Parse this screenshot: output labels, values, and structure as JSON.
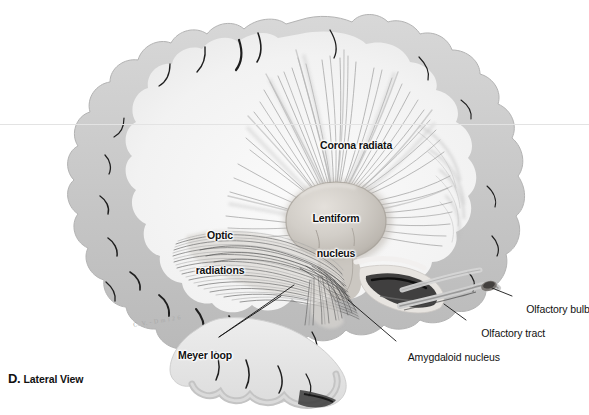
{
  "figure": {
    "kind": "anatomical-illustration",
    "caption_letter": "D.",
    "caption_text": "Lateral View",
    "artist_signature": "C. V. - D m i 2 6",
    "palette": {
      "background": "#ffffff",
      "cortex_gray": "#c9c9c9",
      "cortex_gray_light": "#dcdcdc",
      "white_matter": "#f4f4f4",
      "fiber_line": "#8e8e8e",
      "fiber_line_dark": "#5a5a5a",
      "sulcus_dark": "#1b1b1b",
      "nucleus_fill": "#cfcbc6",
      "nucleus_edge": "#9a948d",
      "label_text": "#111111",
      "leader_line": "#1a1a1a",
      "rule_line": "#e3e3e3"
    }
  },
  "labels": [
    {
      "id": "corona-radiata",
      "text": "Corona radiata",
      "style": "bold",
      "lines": [
        "Corona radiata"
      ],
      "x": 309,
      "y": 134,
      "align": "left"
    },
    {
      "id": "lentiform-nucleus",
      "text": "Lentiform nucleus",
      "style": "bold",
      "lines": [
        "Lentiform",
        "nucleus"
      ],
      "x": 330,
      "y": 196,
      "align": "center"
    },
    {
      "id": "optic-radiations",
      "text": "Optic radiations",
      "style": "bold",
      "lines": [
        "Optic",
        "radiations"
      ],
      "x": 218,
      "y": 211,
      "align": "center"
    },
    {
      "id": "meyer-loop",
      "text": "Meyer loop",
      "style": "bold",
      "lines": [
        "Meyer loop"
      ],
      "x": 167,
      "y": 344,
      "align": "left"
    },
    {
      "id": "olfactory-bulb",
      "text": "Olfactory bulb",
      "style": "plain",
      "lines": [
        "Olfactory bulb"
      ],
      "x": 515,
      "y": 293,
      "align": "left"
    },
    {
      "id": "olfactory-tract",
      "text": "Olfactory tract",
      "style": "plain",
      "lines": [
        "Olfactory tract"
      ],
      "x": 470,
      "y": 317,
      "align": "left"
    },
    {
      "id": "amygdaloid-nucleus",
      "text": "Amygdaloid nucleus",
      "style": "plain",
      "lines": [
        "Amygdaloid nucleus"
      ],
      "x": 398,
      "y": 341,
      "align": "left"
    }
  ]
}
